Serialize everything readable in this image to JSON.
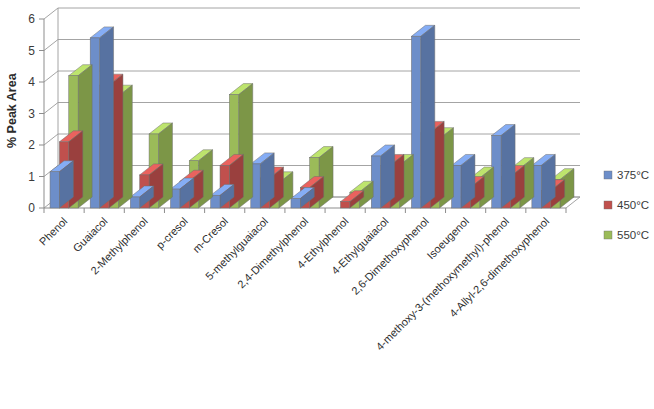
{
  "chart_data": {
    "type": "bar",
    "title": "",
    "xlabel": "",
    "ylabel": "% Peak Area",
    "ylim": [
      0,
      6
    ],
    "yticks": [
      0,
      1,
      2,
      3,
      4,
      5,
      6
    ],
    "grid": true,
    "legend_position": "right",
    "categories": [
      "Phenol",
      "Guaiacol",
      "2-Methylphenol",
      "p-cresol",
      "m-Cresol",
      "5-methylguaiacol",
      "2,4-Dimethylphenol",
      "4-Ethylphenol",
      "4-Ethylguaiacol",
      "2,6-Dimethoxyphenol",
      "Isoeugenol",
      "4-methoxy-3-(methoxymethyl)-phenol",
      "4-Allyl-2,6-dimethoxyphenol"
    ],
    "series": [
      {
        "name": "375°C",
        "color": "#6d8ec9",
        "values": [
          1.15,
          5.4,
          0.35,
          0.6,
          0.4,
          1.4,
          0.3,
          0.0,
          1.65,
          5.45,
          1.35,
          2.3,
          1.35
        ]
      },
      {
        "name": "450°C",
        "color": "#c0504d",
        "values": [
          2.1,
          3.9,
          1.05,
          0.85,
          1.35,
          0.95,
          0.65,
          0.2,
          1.35,
          2.4,
          0.65,
          1.0,
          0.55
        ]
      },
      {
        "name": "550°C",
        "color": "#9bbb59",
        "values": [
          4.2,
          3.55,
          2.35,
          1.5,
          3.6,
          0.8,
          1.6,
          0.5,
          1.35,
          2.2,
          0.95,
          1.25,
          0.9
        ]
      }
    ]
  },
  "legend": {
    "items": [
      {
        "label": "375°C",
        "color": "#6d8ec9"
      },
      {
        "label": "450°C",
        "color": "#c0504d"
      },
      {
        "label": "550°C",
        "color": "#9bbb59"
      }
    ]
  },
  "axis": {
    "y_title": "% Peak Area",
    "y_tick_labels": [
      "0",
      "1",
      "2",
      "3",
      "4",
      "5",
      "6"
    ]
  }
}
